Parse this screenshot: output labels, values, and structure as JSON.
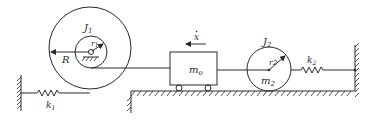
{
  "diagram": {
    "labels": {
      "J1": "J",
      "J1_sub": "1",
      "r1": "r",
      "r1_sub": "1",
      "R": "R",
      "xdot": "x",
      "m0": "m",
      "m0_sub": "o",
      "J2": "J",
      "J2_sub": "2",
      "r2": "r",
      "r2_sub": "2",
      "m2": "m",
      "m2_sub": "2",
      "k1": "k",
      "k1_sub": "1",
      "k2": "k",
      "k2_sub": "2"
    },
    "colors": {
      "stroke": "#2a2a2a",
      "background": "#ffffff"
    }
  }
}
